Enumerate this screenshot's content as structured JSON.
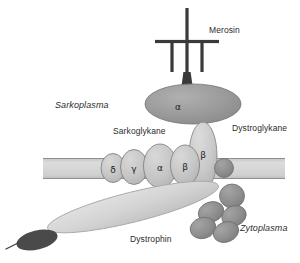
{
  "figure": {
    "background_color": "#ffffff"
  },
  "labels": {
    "merosin": "Merosin",
    "sarkoplasma": "Sarkoplasma",
    "dystroglykane": "Dystroglykane",
    "sarkoglykane": "Sarkoglykane",
    "dystrophin": "Dystrophin",
    "zytoplasma": "Zytoplasma"
  },
  "sarcoglycan_subunits": [
    {
      "symbol": "δ",
      "name": "delta-sarcoglycan"
    },
    {
      "symbol": "γ",
      "name": "gamma-sarcoglycan"
    },
    {
      "symbol": "α",
      "name": "alpha-sarcoglycan"
    },
    {
      "symbol": "β",
      "name": "beta-sarcoglycan"
    }
  ],
  "dystroglycan_subunits": [
    {
      "symbol": "α",
      "name": "alpha-dystroglycan"
    },
    {
      "symbol": "β",
      "name": "beta-dystroglycan"
    }
  ],
  "colors": {
    "membrane_fill": "#d2d2d2",
    "membrane_edge": "#8f8f8f",
    "alpha_dystroglycan_fill": "#9a9a9a",
    "beta_dystroglycan_fill": "#c9c9c9",
    "sarcoglycan_fill": "#c6c6c6",
    "sarcoglycan_edge": "#828282",
    "dystrophin_fill": "#d8d8d8",
    "dystrophin_tail": "#4a4a4a",
    "cytoplasmic_protein_fill": "#8e8e8e",
    "merosin_stroke": "#3a3a3a",
    "text": "#2b2b2b"
  }
}
